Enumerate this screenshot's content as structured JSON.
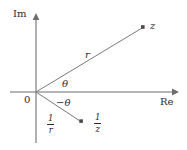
{
  "figure": {
    "type": "complex-plane-diagram",
    "colors": {
      "ink": "#2b2b2b",
      "axis": "#6f6f6f",
      "ray": "#7a7a7a",
      "background": "#ffffff"
    },
    "axes": {
      "imaginary_label": "Im",
      "real_label": "Re",
      "origin_label": "0"
    },
    "labels": {
      "z": "z",
      "one_over_z_numerator": "1",
      "one_over_z_denominator": "z",
      "r": "r",
      "one_over_r_numerator": "1",
      "one_over_r_denominator": "r",
      "theta": "θ",
      "minus_theta": "−θ"
    },
    "geometry": {
      "origin": {
        "x": 36,
        "y": 92
      },
      "real_axis": {
        "x1": 10,
        "y1": 92,
        "x2": 178,
        "y2": 92
      },
      "imaginary_axis": {
        "x1": 36,
        "y1": 143,
        "x2": 36,
        "y2": 14
      },
      "point_z": {
        "x": 143,
        "y": 27
      },
      "point_one_over_z": {
        "x": 81,
        "y": 121
      }
    }
  }
}
